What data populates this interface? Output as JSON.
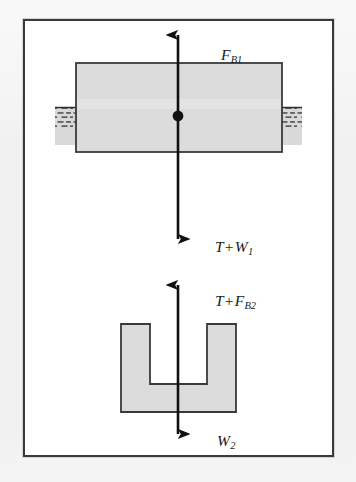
{
  "figure": {
    "name": "free-body-diagram-buoyancy",
    "type": "physics-free-body-diagram",
    "background_color": "#f1f1f1",
    "frame_color": "#3a3a3a",
    "body_fill_color": "#dcdcdc",
    "body_stroke_color": "#3a3a3a",
    "water_fill_color": "#d9d9d9",
    "arrow_color": "#111111",
    "labels": {
      "buoyant_force_top": {
        "symbol": "F",
        "subscript": "B1",
        "text": "F_B1",
        "direction": "up"
      },
      "tension_plus_weight_one": {
        "term_one": "T",
        "operator": "+",
        "term_two": "W",
        "subscript": "1",
        "text": "T + W_1",
        "direction": "down"
      },
      "tension_plus_buoyant_two": {
        "term_one": "T",
        "operator": "+",
        "term_two": "F",
        "subscript": "B2",
        "text": "T + F_B2",
        "direction": "up"
      },
      "weight_two": {
        "symbol": "W",
        "subscript": "2",
        "text": "W_2",
        "direction": "down"
      }
    },
    "objects": {
      "floating_block": {
        "name": "floating-block",
        "shape": "rectangle",
        "fill": "#dcdcdc"
      },
      "water_surface": {
        "name": "water-surface",
        "shape": "hatched-band",
        "fill": "#d9d9d9"
      },
      "center_of_mass_dot": {
        "name": "center-of-mass-dot",
        "shape": "circle",
        "fill": "#111111"
      },
      "u_channel_block": {
        "name": "u-channel-block",
        "shape": "u-channel",
        "fill": "#dcdcdc"
      }
    }
  }
}
